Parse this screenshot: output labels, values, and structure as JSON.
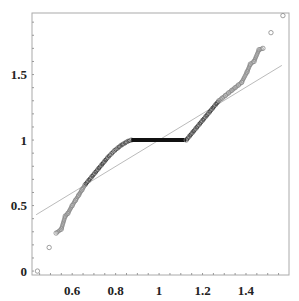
{
  "chart_data": {
    "type": "scatter",
    "title": "",
    "xlabel": "",
    "ylabel": "",
    "xlim": [
      0.415,
      1.598
    ],
    "ylim": [
      -0.03,
      1.97
    ],
    "grid": false,
    "legend": null,
    "x_ticks": [
      0.6,
      0.8,
      1,
      1.2,
      1.4
    ],
    "x_tick_labels": [
      "0.6",
      "0.8",
      "1",
      "1.2",
      "1.4"
    ],
    "y_ticks": [
      0,
      0.5,
      1,
      1.5
    ],
    "y_tick_labels": [
      "0",
      "0.5",
      "1",
      "1.5"
    ],
    "series": [
      {
        "name": "sample points",
        "marker": "open-circle",
        "color": "#888888",
        "x": [
          0.44,
          0.494,
          0.526,
          0.55,
          0.568,
          0.58,
          0.6,
          0.615,
          0.63,
          0.645,
          0.66,
          0.675,
          0.69,
          0.705,
          0.72,
          0.735,
          0.75,
          0.765,
          0.78,
          0.795,
          0.81,
          0.825,
          0.84,
          0.855,
          0.872
        ],
        "y": [
          0.0,
          0.18,
          0.29,
          0.32,
          0.42,
          0.44,
          0.5,
          0.54,
          0.58,
          0.62,
          0.66,
          0.69,
          0.72,
          0.75,
          0.78,
          0.81,
          0.84,
          0.87,
          0.895,
          0.92,
          0.94,
          0.96,
          0.975,
          0.99,
          1.0
        ]
      },
      {
        "name": "flat segment",
        "marker": "dense-line",
        "color": "#111111",
        "x": [
          0.872,
          1.125
        ],
        "y": [
          1.0,
          1.0
        ]
      },
      {
        "name": "upper points",
        "marker": "open-circle",
        "color": "#888888",
        "x": [
          1.125,
          1.14,
          1.155,
          1.17,
          1.185,
          1.2,
          1.215,
          1.23,
          1.245,
          1.26,
          1.275,
          1.29,
          1.305,
          1.32,
          1.335,
          1.35,
          1.365,
          1.38,
          1.405,
          1.42,
          1.437,
          1.46,
          1.478,
          1.515,
          1.57
        ],
        "y": [
          1.0,
          1.03,
          1.06,
          1.09,
          1.12,
          1.15,
          1.18,
          1.21,
          1.24,
          1.27,
          1.3,
          1.32,
          1.34,
          1.36,
          1.38,
          1.4,
          1.42,
          1.44,
          1.52,
          1.58,
          1.6,
          1.69,
          1.7,
          1.82,
          1.95
        ]
      },
      {
        "name": "reference line",
        "marker": "line",
        "color": "#bbbbbb",
        "x": [
          0.434,
          1.565
        ],
        "y": [
          0.43,
          1.57
        ]
      }
    ]
  },
  "axes": {
    "frame_color": "#aaaaaa",
    "label_color": "#222222"
  }
}
